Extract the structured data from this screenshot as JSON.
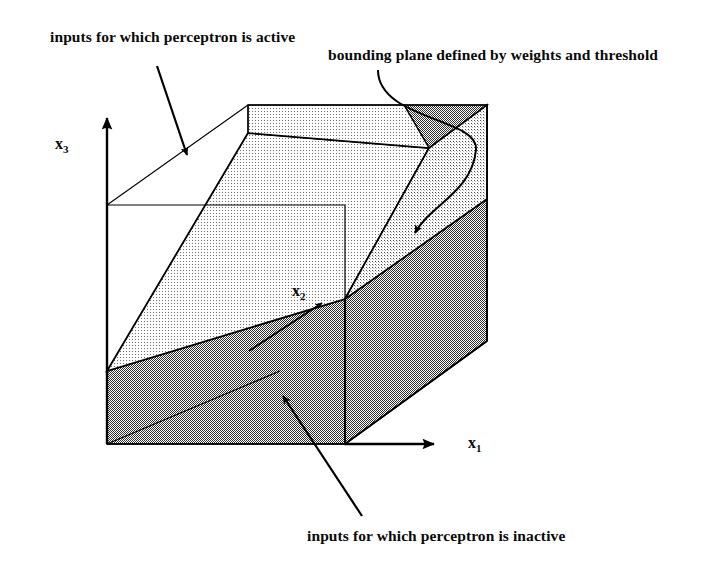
{
  "figure": {
    "background_color": "#ffffff",
    "ink_color": "#000000",
    "active_region_fill": "#e4e4e4",
    "inactive_region_fill": "#a8a8a8",
    "captions": {
      "active": "inputs for which perceptron is active",
      "bounding": "bounding plane defined by weights and threshold",
      "inactive": "inputs for which perceptron is inactive"
    },
    "axes": [
      {
        "name": "x1",
        "base": "x",
        "sub": "1"
      },
      {
        "name": "x2",
        "base": "x",
        "sub": "2"
      },
      {
        "name": "x3",
        "base": "x",
        "sub": "3"
      }
    ],
    "geometry": {
      "projection": "oblique",
      "front_face": [
        [
          107,
          205
        ],
        [
          345,
          205
        ],
        [
          345,
          444
        ],
        [
          107,
          444
        ]
      ],
      "depth_offset": [
        142,
        -100
      ],
      "origin": [
        107,
        444
      ],
      "x1_axis_end": [
        440,
        444
      ],
      "x3_axis_end": [
        107,
        112
      ],
      "x2_axis_end": [
        327,
        299
      ]
    },
    "annotations": [
      {
        "name": "active-leader",
        "from": [
          157,
          68
        ],
        "to": [
          188,
          160
        ],
        "style": "straight-arrow"
      },
      {
        "name": "bounding-leader",
        "from": [
          378,
          78
        ],
        "to": [
          410,
          238
        ],
        "style": "curved-arrow"
      },
      {
        "name": "inactive-leader",
        "from": [
          362,
          516
        ],
        "to": [
          281,
          392
        ],
        "style": "straight-arrow"
      }
    ]
  }
}
